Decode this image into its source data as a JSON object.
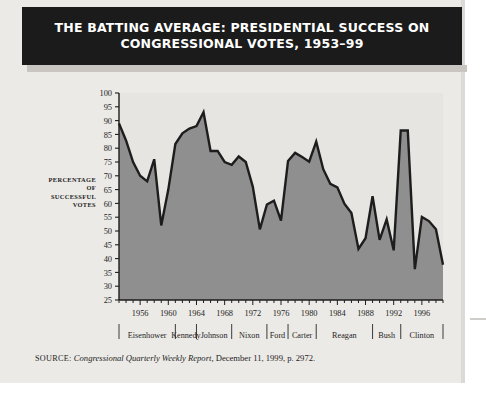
{
  "banner": {
    "line1": "THE BATTING AVERAGE: PRESIDENTIAL SUCCESS ON",
    "line2": "CONGRESSIONAL VOTES, 1953–99"
  },
  "axis_title_lines": [
    "PERCENTAGE",
    "OF",
    "SUCCESSFUL",
    "VOTES"
  ],
  "source": {
    "label": "SOURCE:",
    "publication": "Congressional Quarterly Weekly Report,",
    "rest": " December 11, 1999, p. 2972."
  },
  "colors": {
    "banner_bg": "#1b1b1b",
    "banner_text": "#ffffff",
    "card_bg": "#eceae6",
    "plot_bg": "#e7e5e1",
    "area_fill": "#8f8f8f",
    "line": "#1d1d1d",
    "axis": "#1d1d1d",
    "page_bg": "#ffffff"
  },
  "chart_data": {
    "type": "area",
    "title": "THE BATTING AVERAGE: PRESIDENTIAL SUCCESS ON CONGRESSIONAL VOTES, 1953–99",
    "xlabel": "",
    "ylabel": "PERCENTAGE OF SUCCESSFUL VOTES",
    "ylim": [
      25,
      100
    ],
    "xlim": [
      1953,
      1999
    ],
    "ytick_step": 5,
    "yticks": [
      25,
      30,
      35,
      40,
      45,
      50,
      55,
      60,
      65,
      70,
      75,
      80,
      85,
      90,
      95,
      100
    ],
    "xticks": [
      1956,
      1960,
      1964,
      1968,
      1972,
      1976,
      1980,
      1984,
      1988,
      1992,
      1996
    ],
    "xtick_minor_step": 1,
    "grid": false,
    "legend": "none",
    "x": [
      1953,
      1954,
      1955,
      1956,
      1957,
      1958,
      1959,
      1960,
      1961,
      1962,
      1963,
      1964,
      1965,
      1966,
      1967,
      1968,
      1969,
      1970,
      1971,
      1972,
      1973,
      1974,
      1975,
      1976,
      1977,
      1978,
      1979,
      1980,
      1981,
      1982,
      1983,
      1984,
      1985,
      1986,
      1987,
      1988,
      1989,
      1990,
      1991,
      1992,
      1993,
      1994,
      1995,
      1996,
      1997,
      1998,
      1999
    ],
    "y": [
      89.0,
      82.8,
      75.0,
      70.0,
      68.0,
      76.0,
      52.0,
      65.0,
      81.5,
      85.4,
      87.1,
      88.0,
      93.0,
      79.0,
      79.0,
      75.0,
      74.0,
      77.0,
      75.0,
      66.0,
      50.6,
      59.6,
      61.0,
      53.8,
      75.4,
      78.3,
      76.8,
      75.1,
      82.4,
      72.4,
      67.1,
      65.8,
      59.9,
      56.5,
      43.5,
      47.4,
      62.6,
      46.8,
      54.2,
      43.0,
      86.4,
      86.4,
      36.2,
      55.1,
      53.6,
      50.6,
      37.8
    ],
    "administrations": [
      {
        "name": "Eisenhower",
        "start": 1953,
        "end": 1961
      },
      {
        "name": "Kennedy",
        "start": 1961,
        "end": 1964
      },
      {
        "name": "Johnson",
        "start": 1964,
        "end": 1969
      },
      {
        "name": "Nixon",
        "start": 1969,
        "end": 1974
      },
      {
        "name": "Ford",
        "start": 1974,
        "end": 1977
      },
      {
        "name": "Carter",
        "start": 1977,
        "end": 1981
      },
      {
        "name": "Reagan",
        "start": 1981,
        "end": 1989
      },
      {
        "name": "Bush",
        "start": 1989,
        "end": 1993
      },
      {
        "name": "Clinton",
        "start": 1993,
        "end": 1999
      }
    ]
  }
}
